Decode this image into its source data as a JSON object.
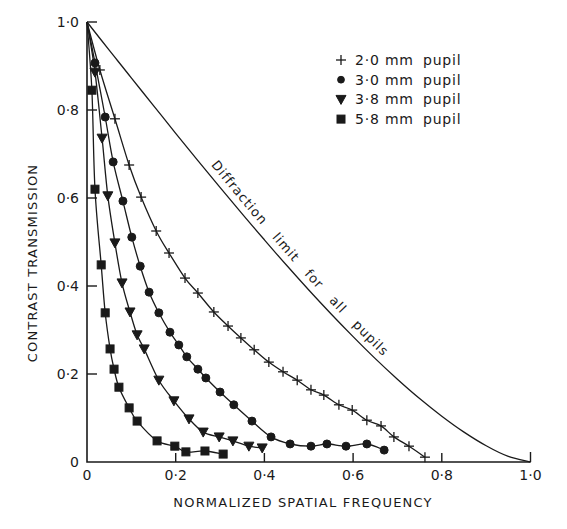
{
  "chart_data": {
    "type": "line",
    "title": "",
    "xlabel": "NORMALIZED SPATIAL FREQUENCY",
    "ylabel": "CONTRAST TRANSMISSION",
    "xlim": [
      0,
      1.0
    ],
    "ylim": [
      0,
      1.0
    ],
    "grid": false,
    "legend_position": "upper right",
    "x_ticks": [
      0,
      0.2,
      0.4,
      0.6,
      0.8,
      1.0
    ],
    "x_tick_labels": [
      "0",
      "0·2",
      "0·4",
      "0·6",
      "0·8",
      "1·0"
    ],
    "y_ticks": [
      0,
      0.2,
      0.4,
      0.6,
      0.8,
      1.0
    ],
    "y_tick_labels": [
      "0",
      "0·2",
      "0·4",
      "0·6",
      "0·8",
      "1·0"
    ],
    "series": [
      {
        "name": "2·0 mm pupil",
        "legend_size": "2·0 mm",
        "legend_word": "pupil",
        "marker": "plus",
        "x": [
          0,
          0.029,
          0.063,
          0.095,
          0.122,
          0.156,
          0.185,
          0.221,
          0.25,
          0.286,
          0.318,
          0.347,
          0.377,
          0.41,
          0.442,
          0.474,
          0.505,
          0.534,
          0.568,
          0.598,
          0.631,
          0.663,
          0.692,
          0.726,
          0.762
        ],
        "values": [
          1.0,
          0.891,
          0.78,
          0.675,
          0.602,
          0.525,
          0.475,
          0.418,
          0.384,
          0.341,
          0.309,
          0.282,
          0.255,
          0.227,
          0.205,
          0.186,
          0.164,
          0.152,
          0.13,
          0.118,
          0.095,
          0.082,
          0.057,
          0.036,
          0.011
        ]
      },
      {
        "name": "3·0 mm pupil",
        "legend_size": "3·0 mm",
        "legend_word": "pupil",
        "marker": "circle",
        "x": [
          0,
          0.018,
          0.041,
          0.059,
          0.081,
          0.101,
          0.12,
          0.14,
          0.162,
          0.187,
          0.207,
          0.225,
          0.25,
          0.268,
          0.3,
          0.331,
          0.372,
          0.415,
          0.458,
          0.505,
          0.541,
          0.584,
          0.631,
          0.67
        ],
        "values": [
          1.0,
          0.907,
          0.784,
          0.682,
          0.593,
          0.511,
          0.445,
          0.386,
          0.339,
          0.295,
          0.266,
          0.239,
          0.211,
          0.191,
          0.159,
          0.13,
          0.093,
          0.057,
          0.041,
          0.036,
          0.041,
          0.036,
          0.041,
          0.027
        ]
      },
      {
        "name": "3·8 mm pupil",
        "legend_size": "3·8 mm",
        "legend_word": "pupil",
        "marker": "triangle-down",
        "x": [
          0,
          0.018,
          0.034,
          0.047,
          0.063,
          0.079,
          0.097,
          0.113,
          0.129,
          0.162,
          0.196,
          0.23,
          0.262,
          0.298,
          0.329,
          0.365,
          0.395
        ],
        "values": [
          1.0,
          0.886,
          0.736,
          0.605,
          0.498,
          0.407,
          0.341,
          0.289,
          0.257,
          0.186,
          0.139,
          0.098,
          0.068,
          0.057,
          0.048,
          0.036,
          0.032
        ]
      },
      {
        "name": "5·8 mm pupil",
        "legend_size": "5·8 mm",
        "legend_word": "pupil",
        "marker": "square",
        "x": [
          0,
          0.011,
          0.018,
          0.032,
          0.041,
          0.052,
          0.061,
          0.072,
          0.095,
          0.113,
          0.158,
          0.198,
          0.223,
          0.266,
          0.307
        ],
        "values": [
          1.0,
          0.845,
          0.62,
          0.448,
          0.339,
          0.257,
          0.211,
          0.17,
          0.123,
          0.093,
          0.048,
          0.036,
          0.023,
          0.025,
          0.018
        ]
      }
    ],
    "reference_curve": {
      "name": "Diffraction limit for all pupils",
      "x": [
        0,
        0.05,
        0.1,
        0.15,
        0.2,
        0.25,
        0.3,
        0.35,
        0.4,
        0.45,
        0.5,
        0.55,
        0.6,
        0.65,
        0.7,
        0.75,
        0.8,
        0.85,
        0.9,
        0.95,
        1.0
      ],
      "values": [
        1.0,
        0.936,
        0.873,
        0.81,
        0.747,
        0.685,
        0.624,
        0.564,
        0.505,
        0.447,
        0.391,
        0.337,
        0.285,
        0.235,
        0.188,
        0.144,
        0.104,
        0.068,
        0.037,
        0.013,
        0.0
      ]
    },
    "annotations": [
      {
        "text": "Diffraction limit for all pupils",
        "along": "reference_curve"
      }
    ]
  },
  "colors": {
    "ink": "#1a1a1a",
    "background": "#ffffff"
  }
}
